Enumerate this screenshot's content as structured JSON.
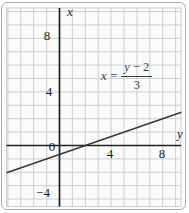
{
  "figure": {
    "background": "#fbfbfa",
    "border_color": "#aeaeae"
  },
  "chart_data": {
    "type": "line",
    "title": "",
    "grid": {
      "enabled": true,
      "step": 1,
      "color": "#c6c9ce"
    },
    "axes": {
      "horizontal": {
        "label": "y",
        "tick_labels": [
          "4",
          "8"
        ],
        "tick_values": [
          4,
          8
        ],
        "range": [
          -4.1,
          9.45
        ]
      },
      "vertical": {
        "label": "x",
        "tick_labels": [
          "8",
          "4",
          "−4"
        ],
        "tick_values": [
          8,
          4,
          -4
        ],
        "range": [
          -4.45,
          10.25
        ]
      }
    },
    "origin_label": "0",
    "series": [
      {
        "name": "x = (y − 2)/3",
        "slope": 0.333333,
        "passes_through": {
          "y": 2,
          "x": 0
        },
        "points": [
          {
            "y": -4,
            "x": -2
          },
          {
            "y": -1,
            "x": -1
          },
          {
            "y": 2,
            "x": 0
          },
          {
            "y": 5,
            "x": 1
          },
          {
            "y": 8,
            "x": 2
          }
        ],
        "color": "#38383a"
      }
    ],
    "equation": {
      "lhs": "x",
      "relation": "=",
      "numerator_variable": "y",
      "numerator_operator": "−",
      "numerator_constant": "2",
      "denominator": "3",
      "display": "x = (y − 2)/3"
    },
    "colors": {
      "axis": "#202020",
      "grid": "#c6c9ce",
      "line": "#38383a",
      "text": "#1b1b1b"
    }
  }
}
